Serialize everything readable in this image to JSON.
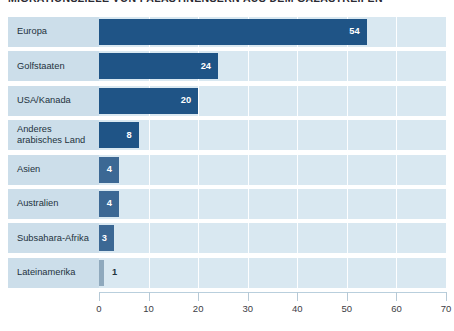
{
  "chart_data": {
    "type": "bar",
    "orientation": "horizontal",
    "title": "MIGRATIONSZIELE VON PALÄSTINENSERN AUS DEM GAZASTREIFEN",
    "xlabel": "",
    "ylabel": "",
    "xlim": [
      0,
      70
    ],
    "xticks": [
      0,
      10,
      20,
      30,
      40,
      50,
      60,
      70
    ],
    "grid": true,
    "legend": "none",
    "categories": [
      "Europa",
      "Golfstaaten",
      "USA/Kanada",
      "Anderes arabisches Land",
      "Asien",
      "Australien",
      "Subsahara-Afrika",
      "Lateinamerika"
    ],
    "values": [
      54,
      24,
      20,
      8,
      4,
      4,
      3,
      1
    ],
    "bars": [
      {
        "label": "Europa",
        "label_lines": [
          "Europa"
        ],
        "value": 54,
        "value_text": "54",
        "style": "dark"
      },
      {
        "label": "Golfstaaten",
        "label_lines": [
          "Golfstaaten"
        ],
        "value": 24,
        "value_text": "24",
        "style": "dark"
      },
      {
        "label": "USA/Kanada",
        "label_lines": [
          "USA/Kanada"
        ],
        "value": 20,
        "value_text": "20",
        "style": "dark"
      },
      {
        "label": "Anderes arabisches Land",
        "label_lines": [
          "Anderes",
          "arabisches Land"
        ],
        "value": 8,
        "value_text": "8",
        "style": "dark"
      },
      {
        "label": "Asien",
        "label_lines": [
          "Asien"
        ],
        "value": 4,
        "value_text": "4",
        "style": "mid"
      },
      {
        "label": "Australien",
        "label_lines": [
          "Australien"
        ],
        "value": 4,
        "value_text": "4",
        "style": "mid"
      },
      {
        "label": "Subsahara-Afrika",
        "label_lines": [
          "Subsahara-Afrika"
        ],
        "value": 3,
        "value_text": "3",
        "style": "mid"
      },
      {
        "label": "Lateinamerika",
        "label_lines": [
          "Lateinamerika"
        ],
        "value": 1,
        "value_text": "1",
        "style": "tiny"
      }
    ],
    "colors": {
      "bar_dark": "#1f5486",
      "bar_mid": "#3c6894",
      "bar_tiny": "#8fa9bd",
      "row_band": "#d9e8f1",
      "label_band": "#ccdeea",
      "gridline": "#ffffff",
      "axis_line": "#b9cfdd",
      "title_text": "#2b2b33",
      "label_text": "#23323d",
      "value_text_light": "#ffffff"
    }
  }
}
